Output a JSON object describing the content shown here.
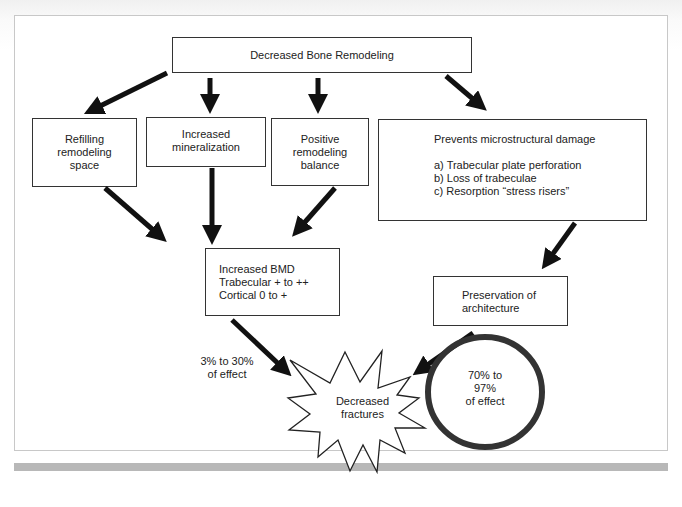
{
  "diagram": {
    "top": {
      "label": "Decreased Bone Remodeling"
    },
    "row1": {
      "refilling": {
        "lines": [
          "Refilling",
          "remodeling",
          "space"
        ]
      },
      "mineralization": {
        "lines": [
          "Increased",
          "mineralization"
        ]
      },
      "positive": {
        "lines": [
          "Positive",
          "remodeling",
          "balance"
        ]
      },
      "prevents": {
        "title": "Prevents microstructural damage",
        "items": [
          "a) Trabecular plate perforation",
          "b) Loss of trabeculae",
          "c) Resorption “stress risers”"
        ]
      }
    },
    "bmd": {
      "lines": [
        "Increased BMD",
        "Trabecular + to ++",
        "Cortical 0 to +"
      ]
    },
    "architecture": {
      "lines": [
        "Preservation of",
        "architecture"
      ]
    },
    "fractures": {
      "lines": [
        "Decreased",
        "fractures"
      ]
    },
    "effect_left": {
      "lines": [
        "3% to 30%",
        "of effect"
      ]
    },
    "effect_right": {
      "lines": [
        "70% to",
        "97%",
        "of effect"
      ]
    }
  },
  "colors": {
    "stroke": "#111111",
    "box_border": "#333333",
    "frame_border": "#c8c8c8",
    "bar": "#b8b8b8"
  }
}
